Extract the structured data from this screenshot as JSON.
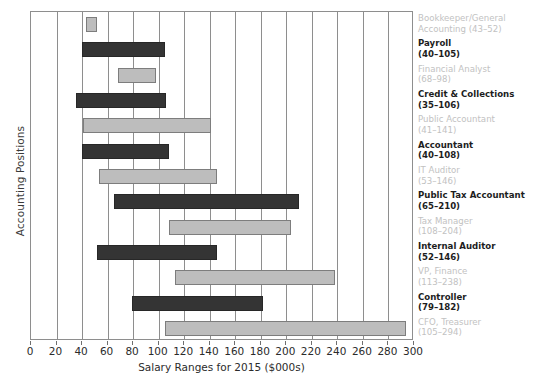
{
  "chart_data": {
    "type": "bar",
    "subtype": "horizontal-range-bar",
    "title": "",
    "xlabel": "Salary Ranges for 2015 ($000s)",
    "ylabel": "Accounting Positions",
    "xlim": [
      0,
      300
    ],
    "xticks": [
      0,
      20,
      40,
      60,
      80,
      100,
      120,
      140,
      160,
      180,
      200,
      220,
      240,
      260,
      280,
      300
    ],
    "xtick_labels": [
      "0",
      "20",
      "40",
      "60",
      "80",
      "100",
      "120",
      "140",
      "160",
      "180",
      "200",
      "220",
      "240",
      "260",
      "280",
      "300"
    ],
    "grid": "vertical",
    "legend": "none",
    "categories": [
      "Bookkeeper/General Accounting",
      "Payroll",
      "Financial Analyst",
      "Credit & Collections",
      "Public Accountant",
      "Accountant",
      "IT Auditor",
      "Public Tax Accountant",
      "Tax Manager",
      "Internal Auditor",
      "VP, Finance",
      "Controller",
      "CFO, Treasurer"
    ],
    "series": [
      {
        "name": "low",
        "values": [
          43,
          40,
          68,
          35,
          41,
          40,
          53,
          65,
          108,
          52,
          113,
          79,
          105
        ]
      },
      {
        "name": "high",
        "values": [
          52,
          105,
          98,
          106,
          141,
          108,
          146,
          210,
          204,
          146,
          238,
          182,
          294
        ]
      }
    ],
    "bars": [
      {
        "label": "Bookkeeper/General Accounting",
        "label_line1": "Bookkeeper/General",
        "label_line2": "Accounting (43–52)",
        "low": 43,
        "high": 52,
        "range_text": "(43–52)",
        "style": "light"
      },
      {
        "label": "Payroll",
        "label_line1": "Payroll",
        "label_line2": "(40–105)",
        "low": 40,
        "high": 105,
        "range_text": "(40–105)",
        "style": "dark"
      },
      {
        "label": "Financial Analyst",
        "label_line1": "Financial Analyst",
        "label_line2": "(68–98)",
        "low": 68,
        "high": 98,
        "range_text": "(68–98)",
        "style": "light"
      },
      {
        "label": "Credit & Collections",
        "label_line1": "Credit & Collections",
        "label_line2": "(35–106)",
        "low": 35,
        "high": 106,
        "range_text": "(35–106)",
        "style": "dark"
      },
      {
        "label": "Public Accountant",
        "label_line1": "Public Accountant",
        "label_line2": "(41–141)",
        "low": 41,
        "high": 141,
        "range_text": "(41–141)",
        "style": "light"
      },
      {
        "label": "Accountant",
        "label_line1": "Accountant",
        "label_line2": "(40–108)",
        "low": 40,
        "high": 108,
        "range_text": "(40–108)",
        "style": "dark"
      },
      {
        "label": "IT Auditor",
        "label_line1": "IT Auditor",
        "label_line2": "(53–146)",
        "low": 53,
        "high": 146,
        "range_text": "(53–146)",
        "style": "light"
      },
      {
        "label": "Public Tax Accountant",
        "label_line1": "Public Tax Accountant",
        "label_line2": "(65–210)",
        "low": 65,
        "high": 210,
        "range_text": "(65–210)",
        "style": "dark"
      },
      {
        "label": "Tax Manager",
        "label_line1": "Tax Manager",
        "label_line2": "(108–204)",
        "low": 108,
        "high": 204,
        "range_text": "(108–204)",
        "style": "light"
      },
      {
        "label": "Internal Auditor",
        "label_line1": "Internal Auditor",
        "label_line2": "(52–146)",
        "low": 52,
        "high": 146,
        "range_text": "(52–146)",
        "style": "dark"
      },
      {
        "label": "VP, Finance",
        "label_line1": "VP, Finance",
        "label_line2": "(113–238)",
        "low": 113,
        "high": 238,
        "range_text": "(113–238)",
        "style": "light"
      },
      {
        "label": "Controller",
        "label_line1": "Controller",
        "label_line2": "(79–182)",
        "low": 79,
        "high": 182,
        "range_text": "(79–182)",
        "style": "dark"
      },
      {
        "label": "CFO, Treasurer",
        "label_line1": "CFO, Treasurer",
        "label_line2": "(105–294)",
        "low": 105,
        "high": 294,
        "range_text": "(105–294)",
        "style": "light"
      }
    ],
    "colors": {
      "light_bar": "#bdbdbd",
      "dark_bar": "#343434",
      "bar_border_light": "#7d7d7d",
      "bar_border_dark": "#272727",
      "gridline": "#8e8e8e",
      "axis": "#8e8e8e",
      "label_dark_text": "#1d1d1d",
      "label_light_text": "#c2c2c2",
      "background": "#ffffff"
    }
  }
}
